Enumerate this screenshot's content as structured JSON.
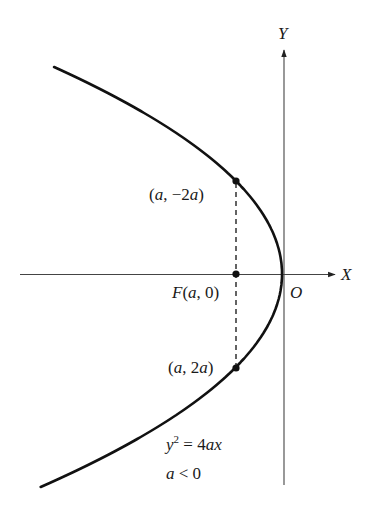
{
  "diagram": {
    "axes": {
      "x_label": "X",
      "y_label": "Y",
      "origin_label": "O"
    },
    "points": {
      "top": {
        "label_open": "(",
        "a": "a",
        "sep": ", ",
        "minus": "−",
        "coef": "2",
        "a2": "a",
        "label_close": ")"
      },
      "focus": {
        "F": "F",
        "open": "(",
        "a": "a",
        "sep": ", ",
        "zero": "0",
        "close": ")"
      },
      "bottom": {
        "open": "(",
        "a": "a",
        "sep": ", ",
        "coef": "2",
        "a2": "a",
        "close": ")"
      }
    },
    "equation": {
      "y": "y",
      "exp": "2",
      "eq": " = 4",
      "ax": "ax"
    },
    "condition": {
      "a": "a",
      "rest": " < 0"
    },
    "geometry": {
      "vertex": [
        282,
        274
      ],
      "focus": [
        236,
        274
      ],
      "top_point": [
        236,
        181
      ],
      "bottom_point": [
        236,
        367
      ],
      "curve_y_top": 67,
      "curve_y_bottom": 487,
      "stroke": "#111111",
      "axis_color": "#444444"
    }
  }
}
